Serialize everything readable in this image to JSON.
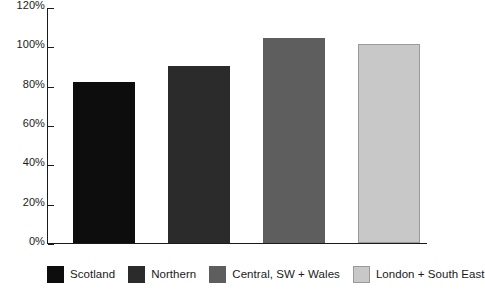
{
  "chart_data": {
    "type": "bar",
    "title": "",
    "subtitle": "",
    "xlabel": "",
    "ylabel": "",
    "categories": [
      "Scotland",
      "Northern",
      "Central, SW + Wales",
      "London + South East"
    ],
    "values": [
      82,
      90,
      104,
      101
    ],
    "value_labels": [
      "82%",
      "90%",
      "104%",
      "101%"
    ],
    "ylim": [
      0,
      120
    ],
    "y_ticks": [
      0,
      20,
      40,
      60,
      80,
      100,
      120
    ],
    "y_tick_labels": [
      "0%",
      "20%",
      "40%",
      "60%",
      "80%",
      "100%",
      "120%"
    ],
    "grid": false,
    "legend_position": "bottom",
    "series": [
      {
        "name": "Scotland",
        "value": 82,
        "color": "#0d0d0d"
      },
      {
        "name": "Northern",
        "value": 90,
        "color": "#2b2b2b"
      },
      {
        "name": "Central, SW + Wales",
        "value": 104,
        "color": "#5e5e5e"
      },
      {
        "name": "London + South East",
        "value": 101,
        "color": "#c8c8c8"
      }
    ]
  },
  "axis": {
    "line_color": "#1a1a1a",
    "tick_color": "#1a1a1a"
  },
  "legend": {
    "items": [
      {
        "label": "Scotland",
        "color": "#0d0d0d"
      },
      {
        "label": "Northern",
        "color": "#2b2b2b"
      },
      {
        "label": "Central, SW + Wales",
        "color": "#5e5e5e"
      },
      {
        "label": "London + South East",
        "color": "#c8c8c8"
      }
    ]
  }
}
